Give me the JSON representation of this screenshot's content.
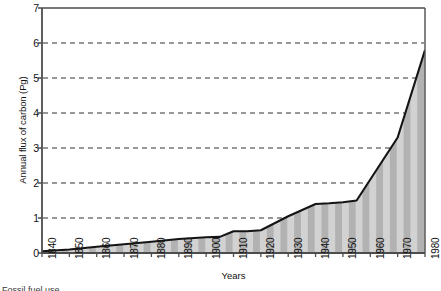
{
  "chart_data": {
    "type": "area",
    "title": "",
    "xlabel": "Years",
    "ylabel": "Annual flux of carbon (Pg)",
    "xlim": [
      1840,
      1980
    ],
    "ylim": [
      0,
      7
    ],
    "yticks": [
      0,
      1,
      2,
      3,
      4,
      5,
      6,
      7
    ],
    "ytick_labels": [
      "0",
      "1",
      "2",
      "3",
      "4",
      "5",
      "6",
      "7"
    ],
    "xticks": [
      1840,
      1850,
      1860,
      1870,
      1880,
      1890,
      1900,
      1910,
      1920,
      1930,
      1940,
      1950,
      1960,
      1970,
      1980
    ],
    "xtick_labels": [
      "1840",
      "1850",
      "1860",
      "1870",
      "1880",
      "1890",
      "1900",
      "1910",
      "1920",
      "1930",
      "1940",
      "1950",
      "1960",
      "1970",
      "1980"
    ],
    "grid": "horizontal-dashed",
    "legend": "none",
    "series": [
      {
        "name": "Annual flux of carbon",
        "x": [
          1840,
          1850,
          1860,
          1870,
          1880,
          1890,
          1900,
          1905,
          1910,
          1915,
          1920,
          1930,
          1940,
          1945,
          1950,
          1955,
          1960,
          1970,
          1980
        ],
        "values": [
          0.05,
          0.1,
          0.18,
          0.25,
          0.32,
          0.4,
          0.45,
          0.46,
          0.62,
          0.62,
          0.65,
          1.05,
          1.4,
          1.42,
          1.45,
          1.5,
          2.1,
          3.3,
          5.8
        ]
      }
    ],
    "fill_pattern": "vertical-stripes",
    "fill_colors": [
      "#d0d0d0",
      "#b4b4b4"
    ],
    "line_color": "#1a1a1a",
    "axis_color": "#4a4a4a",
    "grid_color": "#3c3c3c",
    "background": "#ffffff"
  },
  "caption": {
    "text": "Fossil fuel use ..."
  }
}
